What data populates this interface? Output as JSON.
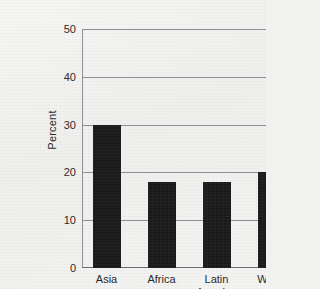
{
  "chart_data": {
    "type": "bar",
    "title": "",
    "xlabel": "",
    "ylabel": "Percent",
    "categories": [
      "Asia",
      "Africa",
      "Latin\nAmerica",
      "World"
    ],
    "values": [
      30,
      18,
      18,
      20
    ],
    "ylim": [
      0,
      50
    ],
    "yticks": [
      0,
      10,
      20,
      30,
      40,
      50
    ],
    "ytick_labels": [
      "0",
      "10",
      "20",
      "30",
      "40",
      "50"
    ],
    "grid": true,
    "legend": "none",
    "bar_color": "#1a1a1a",
    "grid_color": "#8f8f8f",
    "background_color": "#f1f1ef",
    "text_color": "#2b2b2b"
  }
}
